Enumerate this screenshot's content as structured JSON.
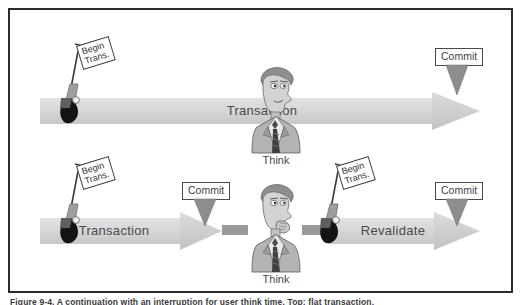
{
  "figure": {
    "caption": "Figure 9-4. A continuation with an interruption for user think time. Top: flat transaction,",
    "border_color": "#2b2b2b",
    "background": "#ffffff"
  },
  "colors": {
    "arrow_fill_light": "#d9d9d9",
    "arrow_fill_mid": "#c9c9c9",
    "arrow_head": "#cfcfcf",
    "connector": "#9a9a9a",
    "commit_arrow": "#8d8d8d",
    "flag_pole": "#8e8e8e",
    "flag_base_dark": "#1c1c1c",
    "figure_gray": "#a8a8a8",
    "text_gray": "#4a4a4a",
    "outline": "#3f3f3f"
  },
  "rows": [
    {
      "name": "flat-transaction",
      "flag": {
        "line1": "Begin",
        "line2": "Trans."
      },
      "arrows": [
        {
          "label": "Transaction"
        }
      ],
      "commits": [
        {
          "label": "Commit"
        }
      ],
      "think": {
        "label": "Think"
      }
    },
    {
      "name": "chained-transaction",
      "flags": [
        {
          "line1": "Begin",
          "line2": "Trans."
        },
        {
          "line1": "Begin",
          "line2": "Trans."
        }
      ],
      "arrows": [
        {
          "label": "Transaction"
        },
        {
          "label": "Revalidate"
        }
      ],
      "commits": [
        {
          "label": "Commit"
        },
        {
          "label": "Commit"
        }
      ],
      "think": {
        "label": "Think"
      }
    }
  ],
  "icons": {
    "flag": "flag-icon",
    "down_arrow": "down-arrow-icon",
    "thinking_person": "thinking-person-icon",
    "right_arrow": "right-arrow-icon"
  }
}
